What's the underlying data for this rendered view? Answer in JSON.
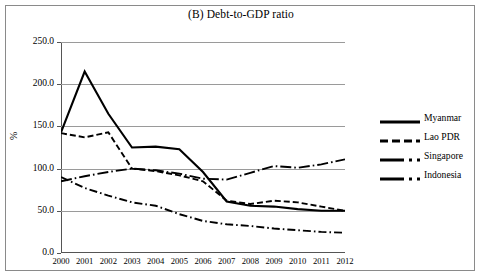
{
  "figure": {
    "title": "(B) Debt-to-GDP ratio",
    "y_axis_title": "%"
  },
  "axis": {
    "y_ticks": [
      "250.0",
      "200.0",
      "150.0",
      "100.0",
      "50.0",
      "0.0"
    ],
    "x_ticks": [
      "2000",
      "2001",
      "2002",
      "2003",
      "2004",
      "2005",
      "2006",
      "2007",
      "2008",
      "2009",
      "2010",
      "2011",
      "2012"
    ]
  },
  "legend": {
    "items": [
      {
        "label": "Myanmar",
        "style": "solid"
      },
      {
        "label": "Lao PDR",
        "style": "dashed"
      },
      {
        "label": "Singapore",
        "style": "longdashdot"
      },
      {
        "label": "Indonesia",
        "style": "dashdot"
      }
    ]
  },
  "chart_data": {
    "type": "line",
    "title": "(B) Debt-to-GDP ratio",
    "xlabel": "",
    "ylabel": "%",
    "ylim": [
      0,
      250
    ],
    "ytick_step": 50,
    "grid": "horizontal",
    "legend_position": "right",
    "x": [
      2000,
      2001,
      2002,
      2003,
      2004,
      2005,
      2006,
      2007,
      2008,
      2009,
      2010,
      2011,
      2012
    ],
    "series": [
      {
        "name": "Myanmar",
        "style": "solid",
        "color": "#000000",
        "values": [
          143,
          215,
          165,
          125,
          126,
          123,
          96,
          61,
          56,
          55,
          52,
          50,
          50
        ]
      },
      {
        "name": "Lao PDR",
        "style": "dashed",
        "color": "#000000",
        "values": [
          142,
          137,
          143,
          100,
          97,
          92,
          85,
          62,
          58,
          62,
          60,
          55,
          50
        ]
      },
      {
        "name": "Singapore",
        "style": "longdashdot",
        "color": "#000000",
        "values": [
          85,
          91,
          96,
          100,
          98,
          94,
          88,
          87,
          95,
          103,
          101,
          105,
          111
        ]
      },
      {
        "name": "Indonesia",
        "style": "dashdot",
        "color": "#000000",
        "values": [
          90,
          77,
          68,
          60,
          56,
          46,
          38,
          34,
          32,
          29,
          27,
          25,
          24
        ]
      }
    ]
  },
  "colors": {
    "line": "#000000",
    "grid": "#9a9a9a",
    "axis": "#555555",
    "frame": "#8a8a8a",
    "background": "#ffffff"
  }
}
